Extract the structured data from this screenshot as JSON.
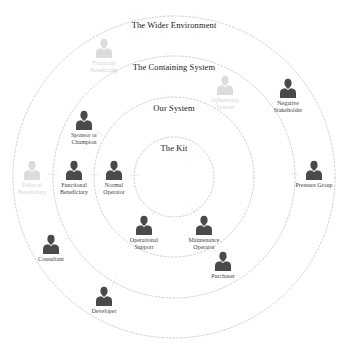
{
  "rings": [
    {
      "id": "wider-environment",
      "title": "The Wider Environment",
      "cx": 174,
      "cy": 177,
      "r": 161,
      "title_x": 174,
      "title_y": 20
    },
    {
      "id": "containing-system",
      "title": "The Containing System",
      "cx": 174,
      "cy": 177,
      "r": 121,
      "title_x": 174,
      "title_y": 62
    },
    {
      "id": "our-system",
      "title": "Our System",
      "cx": 174,
      "cy": 177,
      "r": 80,
      "title_x": 174,
      "title_y": 103
    },
    {
      "id": "the-kit",
      "title": "The Kit",
      "cx": 174,
      "cy": 177,
      "r": 40,
      "title_x": 174,
      "title_y": 143
    }
  ],
  "colors": {
    "ring_stroke": "#c8c8c8",
    "actor_fill": "#4a4a4a",
    "actor_faded_fill": "#dcdcdc",
    "title_text": "#1a1a1a",
    "label_text": "#444444",
    "label_faded_text": "#d4d4d4"
  },
  "actors": [
    {
      "id": "financial-beneficiary",
      "label": "Financial\nBeneficiary",
      "x": 104,
      "y": 38,
      "faded": true
    },
    {
      "id": "influencing-system",
      "label": "Influencing\nSystem",
      "x": 225,
      "y": 75,
      "faded": true
    },
    {
      "id": "negative-stakeholder",
      "label": "Negative\nStakeholder",
      "x": 288,
      "y": 78,
      "faded": false
    },
    {
      "id": "sponsor-or-champion",
      "label": "Sponsor or\nChampion",
      "x": 84,
      "y": 110,
      "faded": false
    },
    {
      "id": "political-beneficiary",
      "label": "Political\nBeneficiary",
      "x": 32,
      "y": 160,
      "faded": true
    },
    {
      "id": "functional-beneficiary",
      "label": "Functional\nBeneficiary",
      "x": 74,
      "y": 160,
      "faded": false
    },
    {
      "id": "normal-operator",
      "label": "Normal\nOperator",
      "x": 114,
      "y": 160,
      "faded": false
    },
    {
      "id": "pressure-group",
      "label": "Pressure Group",
      "x": 314,
      "y": 160,
      "faded": false
    },
    {
      "id": "operational-support",
      "label": "Operational\nSupport",
      "x": 144,
      "y": 215,
      "faded": false
    },
    {
      "id": "maintenance-operator",
      "label": "Maintenance\nOperator",
      "x": 204,
      "y": 215,
      "faded": false
    },
    {
      "id": "purchaser",
      "label": "Purchaser",
      "x": 223,
      "y": 251,
      "faded": false
    },
    {
      "id": "consultant",
      "label": "Consultant",
      "x": 51,
      "y": 234,
      "faded": false
    },
    {
      "id": "developer",
      "label": "Developer",
      "x": 104,
      "y": 286,
      "faded": false
    }
  ]
}
